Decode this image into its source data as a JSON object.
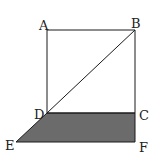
{
  "diagram": {
    "points": {
      "A": "A",
      "B": "B",
      "C": "C",
      "D": "D",
      "E": "E",
      "F": "F"
    },
    "shaded_region": "DCFE",
    "segments": [
      "AB",
      "BC",
      "CD",
      "DA",
      "DB",
      "DE",
      "EF",
      "FC"
    ],
    "colors": {
      "line": "#1a1a1a",
      "shade": "#6b6b6b"
    }
  }
}
